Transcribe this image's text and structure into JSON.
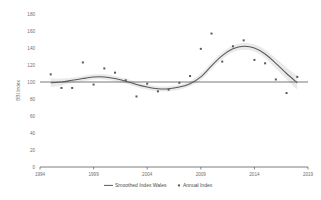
{
  "chart_data": {
    "type": "scatter",
    "title": "",
    "subtitle": "",
    "xlabel": "",
    "ylabel": "BBI Index",
    "xlim": [
      1994,
      2019
    ],
    "ylim": [
      0,
      180
    ],
    "grid": false,
    "legend_position": "bottom",
    "xticks": [
      "1994",
      "1999",
      "2004",
      "2009",
      "2014",
      "2019"
    ],
    "xtick_values": [
      1994,
      1999,
      2004,
      2009,
      2014,
      2019
    ],
    "yticks": [
      "0",
      "20",
      "40",
      "60",
      "80",
      "100",
      "120",
      "140",
      "160",
      "180"
    ],
    "ytick_values": [
      0,
      20,
      40,
      60,
      80,
      100,
      120,
      140,
      160,
      180
    ],
    "reference_line": {
      "label": "",
      "value": 100
    },
    "legend": [
      {
        "name": "Smoothed Index Wales",
        "marker": "line",
        "color": "#595959"
      },
      {
        "name": "Annual Index",
        "marker": "square",
        "color": "#595959"
      }
    ],
    "x": [
      1995,
      1996,
      1997,
      1998,
      1999,
      2000,
      2001,
      2002,
      2003,
      2004,
      2005,
      2006,
      2007,
      2008,
      2009,
      2010,
      2011,
      2012,
      2013,
      2014,
      2015,
      2016,
      2017,
      2018
    ],
    "series": [
      {
        "name": "Annual Index",
        "type": "scatter",
        "color": "#595959",
        "values": [
          109,
          93,
          93,
          123,
          97,
          116,
          111,
          102,
          83,
          98,
          89,
          91,
          99,
          107,
          139,
          157,
          124,
          142,
          149,
          126,
          122,
          103,
          87,
          106
        ]
      },
      {
        "name": "Smoothed Index Wales",
        "type": "line",
        "color": "#595959",
        "values": [
          99,
          100,
          102,
          104,
          106,
          106,
          104,
          101,
          97,
          94,
          92,
          92,
          94,
          98,
          106,
          119,
          131,
          139,
          142,
          140,
          133,
          122,
          110,
          99
        ],
        "band_upper": [
          104,
          104,
          105,
          107,
          109,
          109,
          107,
          104,
          100,
          97,
          95,
          95,
          97,
          101,
          110,
          123,
          135,
          143,
          146,
          144,
          138,
          128,
          117,
          107
        ],
        "band_lower": [
          94,
          96,
          99,
          101,
          103,
          103,
          101,
          98,
          94,
          91,
          89,
          89,
          91,
          95,
          102,
          115,
          127,
          135,
          138,
          136,
          128,
          116,
          103,
          91
        ]
      }
    ]
  }
}
